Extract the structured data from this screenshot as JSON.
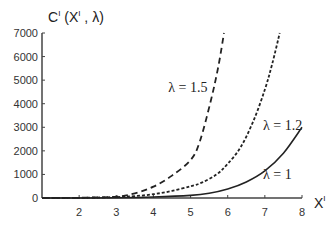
{
  "chart_data": {
    "type": "line",
    "title": "",
    "ylabel": "Cᴵ (Xᴵ , λ)",
    "ylabel_parts": {
      "main": "C",
      "sup": "I",
      "args_open": " (X",
      "args_sup": "I",
      "args_close": " , λ)"
    },
    "xlabel_parts": {
      "main": "X",
      "sup": "I"
    },
    "xlim": [
      1,
      8
    ],
    "ylim": [
      0,
      7000
    ],
    "x_ticks": [
      2,
      3,
      4,
      5,
      6,
      7,
      8
    ],
    "y_ticks": [
      0,
      1000,
      2000,
      3000,
      4000,
      5000,
      6000,
      7000
    ],
    "grid": false,
    "series": [
      {
        "name": "λ = 1",
        "label": "λ = 1",
        "style": "solid",
        "x": [
          1,
          2,
          3,
          4,
          5,
          5.5,
          6,
          6.5,
          7,
          7.5,
          8
        ],
        "values": [
          0,
          2,
          10,
          40,
          110,
          200,
          380,
          680,
          1150,
          1900,
          3000
        ]
      },
      {
        "name": "λ = 1.2",
        "label": "λ = 1.2",
        "style": "dotted",
        "x": [
          1,
          2,
          3,
          3.5,
          4,
          4.5,
          5,
          5.3,
          5.7,
          6,
          6.35,
          6.7,
          7,
          7.2,
          7.4
        ],
        "values": [
          0,
          5,
          40,
          80,
          160,
          300,
          500,
          650,
          1000,
          1450,
          2160,
          3300,
          4600,
          5700,
          7000
        ]
      },
      {
        "name": "λ = 1.5",
        "label": "λ = 1.5",
        "style": "dashed",
        "x": [
          1,
          2,
          3,
          3.5,
          4,
          4.5,
          5,
          5.25,
          5.55,
          5.75,
          5.9
        ],
        "values": [
          0,
          10,
          60,
          200,
          480,
          950,
          1610,
          2400,
          4160,
          5600,
          7000
        ]
      }
    ],
    "annotations": [
      {
        "text": "λ = 1.5",
        "x": 4.4,
        "y": 4500
      },
      {
        "text": "λ = 1.2",
        "x": 6.95,
        "y": 2900
      },
      {
        "text": "λ = 1",
        "x": 6.95,
        "y": 800
      }
    ]
  }
}
